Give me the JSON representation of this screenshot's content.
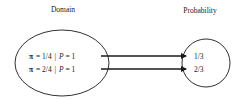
{
  "diagram": {
    "domain_label": "Domain",
    "range_label": "Probability",
    "domain_items": [
      {
        "pi_symbol": "π",
        "pi_value": "= 1/4",
        "separator": "|",
        "p_symbol": "P",
        "p_value": "= 1"
      },
      {
        "pi_symbol": "π",
        "pi_value": "= 2/4",
        "separator": "|",
        "p_symbol": "P",
        "p_value": "= 1"
      }
    ],
    "range_items": [
      "1/3",
      "2/3"
    ],
    "mappings": [
      {
        "from": 0,
        "to": 0
      },
      {
        "from": 1,
        "to": 1
      }
    ]
  }
}
